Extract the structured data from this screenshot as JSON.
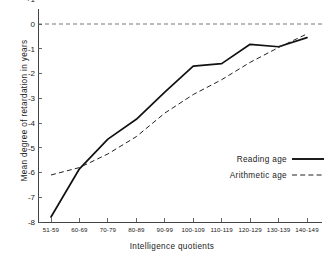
{
  "chart_data": {
    "type": "line",
    "title": "",
    "xlabel": "Intelligence quotients",
    "ylabel": "Mean degree of retardation in years",
    "categories": [
      "51-59",
      "60-69",
      "70-79",
      "80-89",
      "90-99",
      "100-109",
      "110-119",
      "120-129",
      "130-139",
      "140-149"
    ],
    "ylim": [
      -8,
      1
    ],
    "yticks": [
      1,
      0,
      -1,
      -2,
      -3,
      -4,
      -5,
      -6,
      -7,
      -8
    ],
    "ytick_labels": [
      "+1",
      "0",
      "-1",
      "-2",
      "-3",
      "-4",
      "-5",
      "-6",
      "-7",
      "-8"
    ],
    "grid": false,
    "zero_reference_line": 0,
    "legend_position": "center-right",
    "series": [
      {
        "name": "Reading age",
        "style": "solid",
        "color": "#111111",
        "values": [
          -7.8,
          -5.85,
          -4.65,
          -3.85,
          -2.75,
          -1.7,
          -1.6,
          -0.82,
          -0.92,
          -0.55
        ]
      },
      {
        "name": "Arithmetic age",
        "style": "dashed",
        "color": "#222222",
        "values": [
          -6.1,
          -5.8,
          -5.25,
          -4.55,
          -3.6,
          -2.85,
          -2.25,
          -1.55,
          -0.95,
          -0.4
        ]
      }
    ]
  },
  "legend": {
    "items": [
      {
        "label": "Reading age",
        "style": "solid"
      },
      {
        "label": "Arithmetic age",
        "style": "dashed"
      }
    ]
  }
}
